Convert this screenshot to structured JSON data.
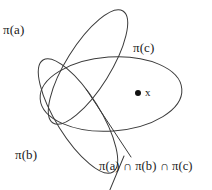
{
  "diagram": {
    "type": "venn-diagram",
    "background_color": "#ffffff",
    "stroke_color": "#3a3a3a",
    "text_color": "#1a1a1a",
    "sets": [
      {
        "id": "pi-a",
        "label": "π(a)",
        "shape": "ellipse",
        "orientation": "rotated-down-right"
      },
      {
        "id": "pi-b",
        "label": "π(b)",
        "shape": "ellipse",
        "orientation": "rotated-up-right"
      },
      {
        "id": "pi-c",
        "label": "π(c)",
        "shape": "ellipse",
        "orientation": "horizontal"
      }
    ],
    "point": {
      "id": "point-x",
      "label": "x",
      "marker": "filled-dot",
      "member_of": "π(c)"
    },
    "annotation": {
      "id": "intersection-caption",
      "label": "π(a) ∩ π(b) ∩ π(c)",
      "leader_lines": 2
    }
  }
}
